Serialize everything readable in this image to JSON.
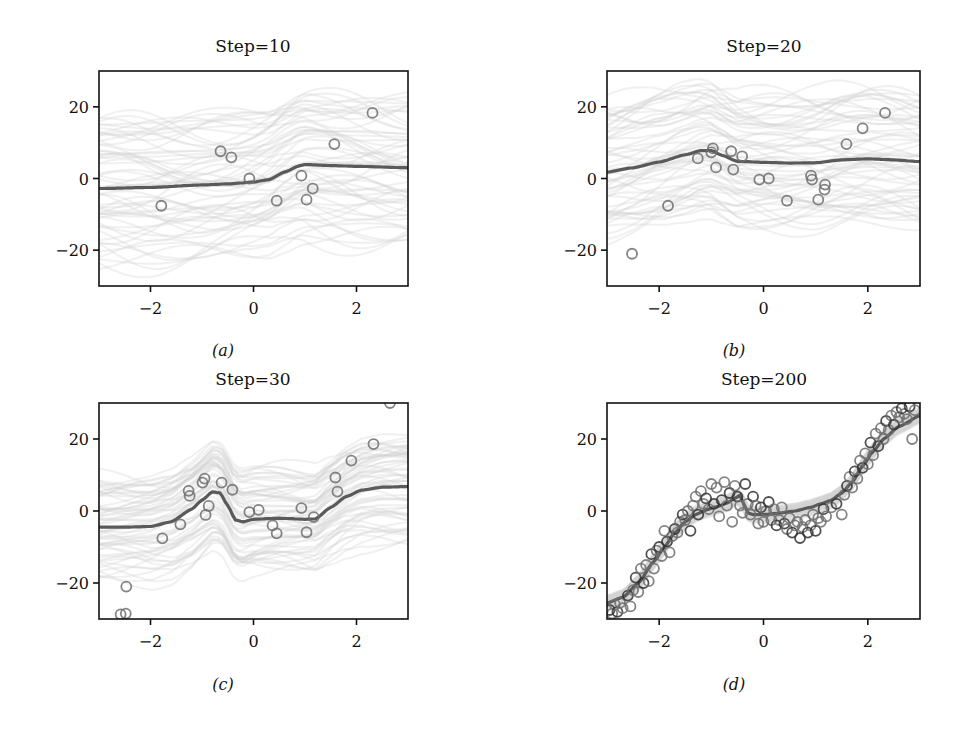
{
  "figure": {
    "panels": [
      {
        "id": "a",
        "title": "Step=10",
        "caption": "(a)"
      },
      {
        "id": "b",
        "title": "Step=20",
        "caption": "(b)"
      },
      {
        "id": "c",
        "title": "Step=30",
        "caption": "(c)"
      },
      {
        "id": "d",
        "title": "Step=200",
        "caption": "(d)"
      }
    ]
  },
  "colors": {
    "mean_line": "#5a5a5a",
    "points": "#6e6e6e",
    "points_dense": "#333333",
    "samples": "#d4d4d4",
    "axis": "#111111"
  },
  "chart_data": [
    {
      "type": "line+scatter",
      "title": "Step=10",
      "caption": "(a)",
      "xlabel": "",
      "ylabel": "",
      "xlim": [
        -3,
        3
      ],
      "ylim": [
        -30,
        30
      ],
      "xticks": [
        -2,
        0,
        2
      ],
      "yticks": [
        -20,
        0,
        20
      ],
      "xtick_labels": [
        "−2",
        "0",
        "2"
      ],
      "ytick_labels": [
        "−20",
        "0",
        "20"
      ],
      "grid": false,
      "legend": null,
      "series": [
        {
          "name": "mean prediction",
          "kind": "line",
          "x": [
            -3,
            -2,
            -1,
            -0.5,
            0,
            0.3,
            0.6,
            0.9,
            1.0,
            1.5,
            2,
            3
          ],
          "y": [
            -2.8,
            -2.5,
            -1.8,
            -1.5,
            -1.0,
            -0.3,
            1.8,
            3.6,
            3.9,
            3.6,
            3.4,
            3.0
          ]
        },
        {
          "name": "observations",
          "kind": "scatter",
          "x": [
            -1.79,
            -0.64,
            -0.43,
            -0.08,
            0.45,
            0.93,
            1.03,
            1.15,
            1.57,
            2.31
          ],
          "y": [
            -7.6,
            7.6,
            5.9,
            0.0,
            -6.2,
            0.8,
            -5.9,
            -2.8,
            9.6,
            18.3
          ]
        },
        {
          "name": "posterior samples",
          "kind": "band",
          "spread": 20
        }
      ]
    },
    {
      "type": "line+scatter",
      "title": "Step=20",
      "caption": "(b)",
      "xlabel": "",
      "ylabel": "",
      "xlim": [
        -3,
        3
      ],
      "ylim": [
        -30,
        30
      ],
      "xticks": [
        -2,
        0,
        2
      ],
      "yticks": [
        -20,
        0,
        20
      ],
      "xtick_labels": [
        "−2",
        "0",
        "2"
      ],
      "ytick_labels": [
        "−20",
        "0",
        "20"
      ],
      "grid": false,
      "legend": null,
      "series": [
        {
          "name": "mean prediction",
          "kind": "line",
          "x": [
            -3,
            -2.5,
            -2,
            -1.5,
            -1.2,
            -1.0,
            -0.8,
            -0.5,
            0,
            0.5,
            1.0,
            1.5,
            2,
            2.5,
            3
          ],
          "y": [
            1.8,
            3.0,
            4.6,
            6.6,
            7.8,
            7.8,
            6.5,
            4.8,
            4.5,
            4.3,
            4.4,
            5.2,
            5.5,
            5.2,
            4.7
          ]
        },
        {
          "name": "observations",
          "kind": "scatter",
          "x": [
            -2.52,
            -1.83,
            -1.26,
            -1.0,
            -0.97,
            -0.91,
            -0.62,
            -0.58,
            -0.41,
            -0.08,
            0.1,
            0.45,
            0.91,
            0.93,
            1.05,
            1.17,
            1.18,
            1.59,
            1.9,
            2.33
          ],
          "y": [
            -21.0,
            -7.6,
            5.6,
            7.3,
            8.4,
            3.1,
            7.6,
            2.5,
            6.2,
            -0.3,
            0.0,
            -6.2,
            0.8,
            -0.3,
            -5.9,
            -3.1,
            -1.7,
            9.6,
            14.0,
            18.3
          ]
        },
        {
          "name": "posterior samples",
          "kind": "band",
          "spread": 18
        }
      ]
    },
    {
      "type": "line+scatter",
      "title": "Step=30",
      "caption": "(c)",
      "xlabel": "",
      "ylabel": "",
      "xlim": [
        -3,
        3
      ],
      "ylim": [
        -30,
        30
      ],
      "xticks": [
        -2,
        0,
        2
      ],
      "yticks": [
        -20,
        0,
        20
      ],
      "xtick_labels": [
        "−2",
        "0",
        "2"
      ],
      "ytick_labels": [
        "−20",
        "0",
        "20"
      ],
      "grid": false,
      "legend": null,
      "series": [
        {
          "name": "mean prediction",
          "kind": "line",
          "x": [
            -3,
            -2.5,
            -2,
            -1.6,
            -1.2,
            -1.0,
            -0.8,
            -0.65,
            -0.5,
            -0.35,
            -0.2,
            0,
            0.5,
            1.0,
            1.2,
            1.5,
            1.8,
            2.1,
            2.5,
            3
          ],
          "y": [
            -4.5,
            -4.5,
            -4.3,
            -3.0,
            0.5,
            3.0,
            5.3,
            5.0,
            1.5,
            -2.5,
            -3.0,
            -2.3,
            -2.0,
            -2.3,
            -2.2,
            1.0,
            4.0,
            5.8,
            6.6,
            6.8
          ]
        },
        {
          "name": "observations",
          "kind": "scatter",
          "x": [
            -2.58,
            -2.48,
            -2.47,
            -1.77,
            -1.42,
            -1.26,
            -1.24,
            -0.99,
            -0.95,
            -0.93,
            -0.87,
            -0.62,
            -0.41,
            -0.08,
            0.1,
            0.37,
            0.45,
            0.93,
            1.03,
            1.17,
            1.59,
            1.63,
            1.9,
            2.33,
            2.65
          ],
          "y": [
            -28.7,
            -28.5,
            -21.0,
            -7.6,
            -3.7,
            5.6,
            4.2,
            7.9,
            9.0,
            -1.1,
            1.4,
            7.9,
            5.9,
            -0.3,
            0.3,
            -4.0,
            -6.2,
            0.8,
            -5.9,
            -1.7,
            9.3,
            5.4,
            14.0,
            18.6,
            30.0
          ]
        },
        {
          "name": "posterior samples",
          "kind": "band",
          "spread": 14
        }
      ]
    },
    {
      "type": "line+scatter",
      "title": "Step=200",
      "caption": "(d)",
      "xlabel": "",
      "ylabel": "",
      "xlim": [
        -3,
        3
      ],
      "ylim": [
        -30,
        30
      ],
      "xticks": [
        -2,
        0,
        2
      ],
      "yticks": [
        -20,
        0,
        20
      ],
      "xtick_labels": [
        "−2",
        "0",
        "2"
      ],
      "ytick_labels": [
        "−20",
        "0",
        "20"
      ],
      "grid": false,
      "legend": null,
      "series": [
        {
          "name": "mean prediction",
          "kind": "line",
          "x": [
            -3,
            -2.7,
            -2.4,
            -2.1,
            -1.9,
            -1.7,
            -1.5,
            -1.3,
            -1.1,
            -0.9,
            -0.7,
            -0.55,
            -0.45,
            -0.38,
            -0.3,
            -0.2,
            0,
            0.3,
            0.6,
            0.9,
            1.1,
            1.3,
            1.5,
            1.7,
            1.9,
            2.1,
            2.3,
            2.6,
            3
          ],
          "y": [
            -25.5,
            -24.0,
            -20.0,
            -14.0,
            -10.0,
            -6.0,
            -3.0,
            -1.0,
            0.3,
            1.2,
            2.2,
            3.5,
            4.4,
            2.0,
            -0.5,
            -1.0,
            -1.0,
            -0.6,
            0.0,
            1.0,
            2.0,
            3.0,
            5.0,
            8.0,
            12.5,
            16.5,
            20.0,
            23.5,
            26.5
          ]
        },
        {
          "name": "observations (~200, summary)",
          "kind": "scatter",
          "x": [
            -2.95,
            -2.9,
            -2.85,
            -2.8,
            -2.75,
            -2.7,
            -2.6,
            -2.55,
            -2.5,
            -2.45,
            -2.4,
            -2.35,
            -2.3,
            -2.25,
            -2.2,
            -2.15,
            -2.1,
            -2.05,
            -2.0,
            -1.95,
            -1.9,
            -1.85,
            -1.8,
            -1.75,
            -1.7,
            -1.65,
            -1.6,
            -1.55,
            -1.5,
            -1.45,
            -1.4,
            -1.35,
            -1.3,
            -1.25,
            -1.2,
            -1.15,
            -1.1,
            -1.05,
            -1.0,
            -0.95,
            -0.9,
            -0.85,
            -0.8,
            -0.75,
            -0.7,
            -0.65,
            -0.6,
            -0.55,
            -0.5,
            -0.45,
            -0.4,
            -0.35,
            -0.3,
            -0.25,
            -0.2,
            -0.15,
            -0.1,
            -0.05,
            0.0,
            0.05,
            0.1,
            0.15,
            0.2,
            0.25,
            0.3,
            0.35,
            0.4,
            0.45,
            0.5,
            0.55,
            0.6,
            0.65,
            0.7,
            0.75,
            0.8,
            0.85,
            0.9,
            0.95,
            1.0,
            1.05,
            1.1,
            1.15,
            1.2,
            1.3,
            1.4,
            1.5,
            1.55,
            1.6,
            1.65,
            1.7,
            1.75,
            1.8,
            1.85,
            1.9,
            1.95,
            2.0,
            2.05,
            2.1,
            2.15,
            2.2,
            2.25,
            2.3,
            2.35,
            2.4,
            2.45,
            2.5,
            2.55,
            2.6,
            2.65,
            2.7,
            2.75,
            2.8,
            2.85,
            2.9
          ],
          "y": [
            -27.5,
            -28.5,
            -26.0,
            -28.0,
            -25.5,
            -27.0,
            -23.5,
            -26.5,
            -22.0,
            -18.5,
            -22.5,
            -16.0,
            -20.0,
            -15.0,
            -19.5,
            -12.0,
            -16.0,
            -11.0,
            -10.0,
            -12.5,
            -5.5,
            -8.5,
            -11.5,
            -7.0,
            -5.0,
            -6.0,
            -3.0,
            -1.0,
            -2.5,
            0.0,
            -5.5,
            1.5,
            4.0,
            -1.0,
            5.5,
            2.0,
            3.5,
            0.5,
            7.5,
            2.0,
            6.5,
            -1.5,
            3.0,
            8.0,
            1.5,
            5.0,
            -3.0,
            7.0,
            4.0,
            1.5,
            -0.5,
            7.5,
            2.0,
            -1.0,
            4.0,
            1.5,
            -3.5,
            1.0,
            -3.0,
            0.0,
            2.5,
            -2.5,
            0.5,
            -4.0,
            -2.5,
            1.0,
            -3.5,
            -5.0,
            -2.0,
            -6.0,
            -4.0,
            -3.0,
            -7.5,
            -4.5,
            -2.5,
            -6.0,
            -4.0,
            -1.0,
            -5.5,
            -2.0,
            -3.0,
            0.5,
            -1.5,
            1.0,
            2.0,
            -1.0,
            4.5,
            7.0,
            9.5,
            6.5,
            11.0,
            9.0,
            14.0,
            12.0,
            16.0,
            13.0,
            19.0,
            15.5,
            21.5,
            18.0,
            23.0,
            20.0,
            25.0,
            22.5,
            26.5,
            24.0,
            27.5,
            26.0,
            28.5,
            27.0,
            25.5,
            29.0,
            20.0,
            28.0
          ]
        },
        {
          "name": "posterior samples",
          "kind": "band",
          "spread": 2
        }
      ]
    }
  ]
}
